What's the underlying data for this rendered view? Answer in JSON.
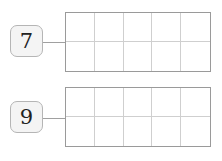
{
  "items": [
    {
      "number": "7",
      "frame": {
        "columns": 5,
        "rows": 2,
        "filled": 0
      }
    },
    {
      "number": "9",
      "frame": {
        "columns": 5,
        "rows": 2,
        "filled": 0
      }
    }
  ]
}
